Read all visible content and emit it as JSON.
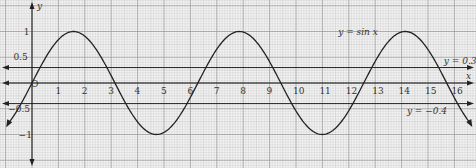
{
  "chart_data": {
    "type": "line",
    "title": "",
    "xlabel": "x",
    "ylabel": "y",
    "xlim": [
      -0.9,
      16.9
    ],
    "ylim": [
      -1.6,
      1.6
    ],
    "grid": true,
    "x_ticks": [
      "1",
      "2",
      "3",
      "4",
      "5",
      "6",
      "7",
      "8",
      "9",
      "10",
      "11",
      "12",
      "13",
      "14",
      "15",
      "16"
    ],
    "y_ticks": [
      "1",
      "0.5",
      "-0.5",
      "-1"
    ],
    "origin_label": "O",
    "series": [
      {
        "name": "y = sin x",
        "function": "sin(x)",
        "x_range": [
          -0.9,
          16.6
        ]
      },
      {
        "name": "y = 0.3",
        "function": "0.3",
        "constant": 0.3
      },
      {
        "name": "y = -0.4",
        "function": "-0.4",
        "constant": -0.4
      }
    ],
    "annotations": [
      {
        "text": "y = sin x",
        "x": 11.6,
        "y": 1.0
      },
      {
        "text": "y = 0.3",
        "x": 15.6,
        "y": 0.42
      },
      {
        "text": "y = −0.4",
        "x": 14.2,
        "y": -0.55
      }
    ],
    "colors": {
      "curve": "#222222",
      "grid_minor": "#c9c9c9",
      "grid_major": "#9a9a9a",
      "axis": "#111111",
      "background": "#f4f4f4"
    }
  },
  "labels": {
    "y_axis": "y",
    "x_axis": "x",
    "sin_label": "y = sin x",
    "line_03_label": "y = 0.3",
    "line_m04_label": "y = −0.4"
  }
}
